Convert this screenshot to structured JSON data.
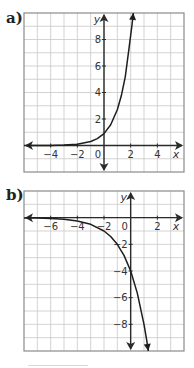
{
  "labels": {
    "a": "a)",
    "b": "b)"
  },
  "colors": {
    "grid": "#c8c8c8",
    "frame": "#8a8a8a",
    "axis": "#2a2a2a",
    "curve": "#1e1e1e"
  },
  "chart_data": [
    {
      "id": "a",
      "type": "line",
      "title": "a)",
      "xlabel": "x",
      "ylabel": "y",
      "xlim": [
        -6,
        6
      ],
      "ylim": [
        -2,
        10
      ],
      "grid": true,
      "grid_step": 1,
      "x_ticks": [
        -4,
        -2,
        0,
        2,
        4
      ],
      "x_tick_labels": [
        "−4",
        "−2",
        "0",
        "2",
        "4"
      ],
      "y_ticks": [
        2,
        4,
        6,
        8
      ],
      "y_tick_labels": [
        "2",
        "4",
        "6",
        "8"
      ],
      "series": [
        {
          "name": "exponential growth",
          "x": [
            -6,
            -5,
            -4,
            -3,
            -2,
            -1,
            -0.5,
            0,
            0.5,
            1,
            1.3,
            1.6,
            1.9,
            2.1,
            2.2
          ],
          "y": [
            0.001,
            0.004,
            0.011,
            0.033,
            0.1,
            0.3,
            0.52,
            0.9,
            1.56,
            2.7,
            3.75,
            5.2,
            7.5,
            9.1,
            10
          ]
        }
      ]
    },
    {
      "id": "b",
      "type": "line",
      "title": "b)",
      "xlabel": "x",
      "ylabel": "y",
      "xlim": [
        -8,
        4
      ],
      "ylim": [
        -10,
        2
      ],
      "grid": true,
      "grid_step": 1,
      "x_ticks": [
        -6,
        -4,
        -2,
        0,
        2
      ],
      "x_tick_labels": [
        "−6",
        "−4",
        "−2",
        "0",
        "2"
      ],
      "y_ticks": [
        -2,
        -4,
        -6,
        -8
      ],
      "y_tick_labels": [
        "−2",
        "−4",
        "−6",
        "−8"
      ],
      "series": [
        {
          "name": "reflected exponential",
          "x": [
            -8,
            -7,
            -6,
            -5,
            -4,
            -3,
            -2,
            -1.5,
            -1,
            -0.5,
            0,
            0.5,
            1,
            1.2,
            1.32
          ],
          "y": [
            -0.016,
            -0.031,
            -0.063,
            -0.125,
            -0.25,
            -0.5,
            -1,
            -1.41,
            -2,
            -2.83,
            -4,
            -5.66,
            -8,
            -9.19,
            -10
          ]
        }
      ]
    }
  ]
}
